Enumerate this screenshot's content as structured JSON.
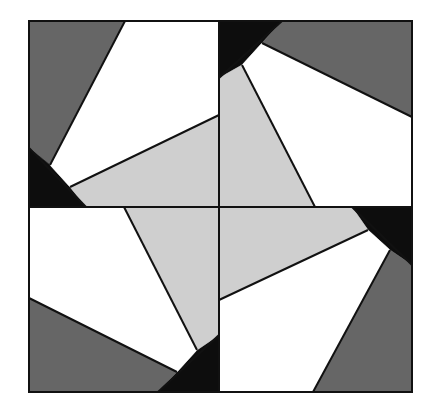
{
  "diagram": {
    "title": "",
    "type": "pinwheel-quilt-block",
    "canvas": {
      "width": 433,
      "height": 416,
      "background": "#ffffff"
    },
    "outer_square": {
      "x": 29,
      "y": 21,
      "width": 383,
      "height": 371
    },
    "dividers": {
      "vertical_x": 219,
      "horizontal_y": 207
    },
    "colors": {
      "dark_gray": "#666666",
      "black": "#0d0d0d",
      "white": "#ffffff",
      "light_gray": "#cfcfcf",
      "stroke": "#111111"
    },
    "quadrants": [
      {
        "name": "top-left",
        "pieces": [
          {
            "fill": "dark_gray",
            "points": "29,21 125,21 50,165 29,148"
          },
          {
            "fill": "black",
            "points": "29,148 50,165 70,187 86,207 29,207"
          },
          {
            "fill": "white",
            "points": "125,21 219,21 219,115 70,187 50,165"
          },
          {
            "fill": "light_gray",
            "points": "70,187 219,115 219,207 86,207"
          }
        ]
      },
      {
        "name": "top-right",
        "pieces": [
          {
            "fill": "black",
            "points": "219,21 282,21 262,43 242,65 219,78"
          },
          {
            "fill": "dark_gray",
            "points": "282,21 412,21 412,117 262,43"
          },
          {
            "fill": "white",
            "points": "262,43 412,117 412,207 315,207 242,65"
          },
          {
            "fill": "light_gray",
            "points": "219,78 242,65 315,207 219,207"
          }
        ]
      },
      {
        "name": "bottom-right",
        "pieces": [
          {
            "fill": "black",
            "points": "352,207 412,207 412,265 390,250 368,230"
          },
          {
            "fill": "light_gray",
            "points": "219,207 352,207 368,230 219,300"
          },
          {
            "fill": "white",
            "points": "219,300 368,230 390,250 313,392 219,392"
          },
          {
            "fill": "dark_gray",
            "points": "390,250 412,265 412,392 313,392"
          }
        ]
      },
      {
        "name": "bottom-left",
        "pieces": [
          {
            "fill": "black",
            "points": "219,335 219,392 158,392 177,372 197,350"
          },
          {
            "fill": "light_gray",
            "points": "124,207 219,207 219,335 197,350"
          },
          {
            "fill": "white",
            "points": "29,207 124,207 197,350 177,372 29,298"
          },
          {
            "fill": "dark_gray",
            "points": "29,298 177,372 158,392 29,392"
          }
        ]
      }
    ],
    "edges": [
      "125,21 50,165",
      "219,115 70,187",
      "29,148 86,207",
      "282,21 219,78",
      "262,43 412,117",
      "242,65 315,207",
      "352,207 412,265",
      "368,230 219,300",
      "390,250 313,392",
      "219,335 158,392",
      "124,207 197,350",
      "29,298 177,372"
    ]
  }
}
